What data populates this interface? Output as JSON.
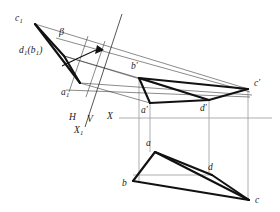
{
  "figure": {
    "colors": {
      "object_line": "#1a1a1a",
      "construction_line": "#8c8c8c",
      "thin_projector": "#3a3a3a",
      "background": "#ffffff"
    },
    "labels": {
      "c1": "c",
      "c1_sub": "1",
      "beta": "β",
      "d1b1": "d",
      "d1b1_sub": "1",
      "d1b1_rest": "(b",
      "d1b1_sub2": "1",
      "d1b1_close": ")",
      "a1": "a",
      "a1_sub": "1",
      "b_prime": "b",
      "b_prime_mark": "′",
      "c_prime": "c",
      "c_prime_mark": "′",
      "a_prime": "a",
      "a_prime_mark": "′",
      "d_prime": "d",
      "d_prime_mark": "′",
      "a": "a",
      "b": "b",
      "c": "c",
      "d": "d",
      "h": "H",
      "v": "V",
      "x1": "X",
      "x1_sub": "1",
      "x": "X"
    },
    "geometry": {
      "aux_view": {
        "name": "auxiliary-view-triangle",
        "c1": [
          35,
          24
        ],
        "d1b1": [
          64,
          56
        ],
        "a1": [
          80,
          83
        ]
      },
      "front_view": {
        "name": "front-view-quad",
        "b_prime": [
          139,
          78
        ],
        "a_prime": [
          150,
          103
        ],
        "d_prime": [
          209,
          100
        ],
        "c_prime": [
          248,
          89
        ]
      },
      "top_view": {
        "name": "top-view-quad",
        "a": [
          155,
          152
        ],
        "b": [
          133,
          181
        ],
        "d": [
          212,
          175
        ],
        "c": [
          249,
          200
        ]
      },
      "x_axis": {
        "y": 118,
        "x_start": 119,
        "x_end": 272
      },
      "x1_axis": {
        "from": [
          122,
          14
        ],
        "to": [
          85,
          127
        ]
      },
      "verticals": [
        139,
        150,
        209,
        248
      ]
    }
  }
}
